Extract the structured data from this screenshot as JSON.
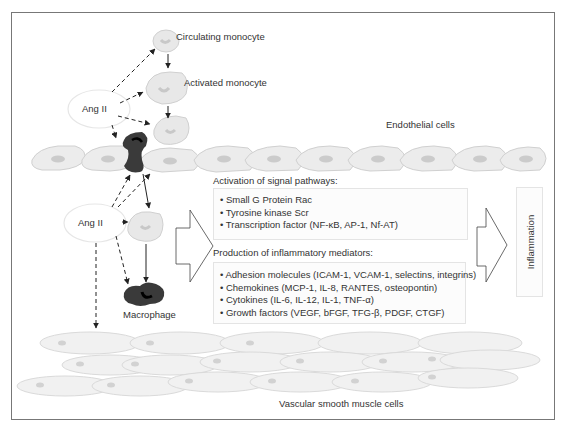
{
  "labels": {
    "circulating_monocyte": "Circulating monocyte",
    "activated_monocyte": "Activated monocyte",
    "ang_ii_top": "Ang II",
    "ang_ii_bottom": "Ang II",
    "endothelial_cells": "Endothelial cells",
    "macrophage": "Macrophage",
    "vascular_smooth_muscle_cells": "Vascular smooth muscle cells",
    "inflammation": "Inflammation"
  },
  "signal_pathways": {
    "title": "Activation of signal pathways:",
    "items": [
      "Small G Protein Rac",
      "Tyrosine kinase Scr",
      "Transcription factor (NF-κB, AP-1, Nf-AT)"
    ]
  },
  "inflammatory_mediators": {
    "title": "Production of inflammatory mediators:",
    "items": [
      "Adhesion molecules (ICAM-1, VCAM-1, selectins, integrins)",
      "Chemokines (MCP-1, IL-8, RANTES, osteopontin)",
      "Cytokines (IL-6, IL-12, IL-1, TNF-α)",
      "Growth factors (VEGF, bFGF, TFG-β, PDGF, CTGF)"
    ]
  },
  "colors": {
    "cell_fill": "#ececec",
    "cell_stroke": "#d0d0d0",
    "nucleus": "#c4c4c4",
    "macrophage": "#3a3a3a",
    "arrow": "#222222",
    "frame": "#777777"
  }
}
